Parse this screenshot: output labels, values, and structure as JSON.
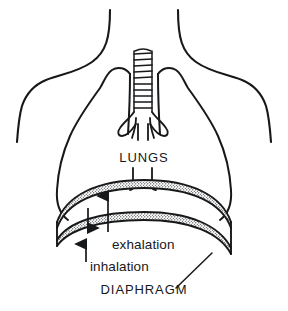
{
  "figure": {
    "background_color": "#ffffff",
    "ink_color": "#17181a"
  },
  "labels": {
    "lungs": "LUNGS",
    "diaphragm": "DIAPHRAGM",
    "exhalation": "exhalation",
    "inhalation": "inhalation"
  },
  "annotations": {
    "exhalation_arrow": "arrow-up-long",
    "inhalation_arrow": "arrow-up-short",
    "descent_arrow": "arrow-down-short",
    "diaphragm_leader": "leader-line"
  },
  "anatomy": {
    "torso": "body-outline",
    "trachea": "trachea-cartilage-rings",
    "bronchi": "bronchial-branches",
    "left_lung": "left-lung-outline",
    "right_lung": "right-lung-outline",
    "diaphragm_exhaled": "diaphragm-raised-dome",
    "diaphragm_inhaled": "diaphragm-lowered-dome"
  }
}
